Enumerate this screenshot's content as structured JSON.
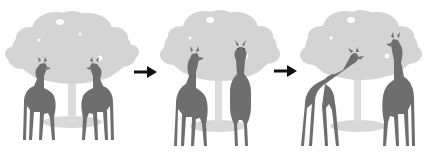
{
  "figure": {
    "background_color": "#ffffff",
    "width": 433,
    "height": 161,
    "panel_count": 3,
    "arrow_count": 2,
    "arrow_color": "#111111",
    "arrow_glyph": "right-arrow"
  },
  "palette": {
    "canopy": "#d4d4d4",
    "canopy_shade": "#c9c9c9",
    "trunk": "#dcdcdc",
    "ground_shadow": "#d8d8d8",
    "giraffe_body": "#6e6e6e",
    "giraffe_body_dark": "#646464",
    "giraffe_body_light": "#7a7a7a",
    "background": "#ffffff",
    "arrow": "#111111"
  },
  "panels": [
    {
      "id": "panel-1",
      "index": 1,
      "label": "",
      "x": 4,
      "width": 133,
      "tree": {
        "name": "acacia-tree",
        "canopy_cx": 68,
        "canopy_cy": 52
      },
      "giraffes": [
        {
          "name": "giraffe-left",
          "pose": "standing-head-up-facing-right",
          "facing": "right",
          "neck": "vertical"
        },
        {
          "name": "giraffe-right",
          "pose": "standing-head-up-facing-left",
          "facing": "left",
          "neck": "vertical"
        }
      ]
    },
    {
      "id": "panel-2",
      "index": 2,
      "label": "",
      "x": 160,
      "width": 120,
      "tree": {
        "name": "acacia-tree",
        "canopy_cx": 60,
        "canopy_cy": 50
      },
      "giraffes": [
        {
          "name": "giraffe-left",
          "pose": "standing-head-up-facing-right",
          "facing": "right",
          "neck": "vertical"
        },
        {
          "name": "giraffe-right",
          "pose": "standing-front-facing-viewer",
          "facing": "front",
          "neck": "vertical"
        }
      ]
    },
    {
      "id": "panel-3",
      "index": 3,
      "label": "",
      "x": 295,
      "width": 136,
      "tree": {
        "name": "acacia-tree",
        "canopy_cx": 70,
        "canopy_cy": 50
      },
      "giraffes": [
        {
          "name": "giraffe-left",
          "pose": "neck-raised-diagonal-facing-right",
          "facing": "right",
          "neck": "diagonal"
        },
        {
          "name": "giraffe-right",
          "pose": "standing-head-up-facing-left",
          "facing": "left",
          "neck": "vertical"
        }
      ]
    }
  ],
  "arrows": [
    {
      "name": "arrow-1",
      "from_panel": "panel-1",
      "to_panel": "panel-2",
      "x": 134,
      "y": 64
    },
    {
      "name": "arrow-2",
      "from_panel": "panel-2",
      "to_panel": "panel-3",
      "x": 274,
      "y": 63
    }
  ]
}
